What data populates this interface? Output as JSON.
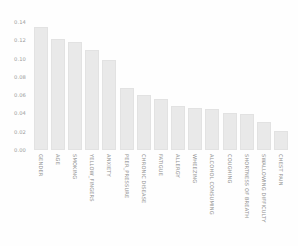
{
  "chart_data": {
    "type": "bar",
    "title": "",
    "xlabel": "",
    "ylabel": "",
    "ylim": [
      0.0,
      0.14
    ],
    "yticks": [
      "0.14",
      "0.12",
      "0.10",
      "0.08",
      "0.06",
      "0.04",
      "0.02",
      "0.00"
    ],
    "ytick_values": [
      0.14,
      0.12,
      0.1,
      0.08,
      0.06,
      0.04,
      0.02,
      0.0
    ],
    "grid": false,
    "legend": "none",
    "categories": [
      "GENDER",
      "AGE",
      "SMOKING",
      "YELLOW_FINGERS",
      "ANXIETY",
      "PEER_PRESSURE",
      "CHRONIC DISEASE",
      "FATIGUE",
      "ALLERGY",
      "WHEEZING",
      "ALCOHOL CONSUMING",
      "COUGHING",
      "SHORTNESS OF BREATH",
      "SWALLOWING DIFFICULTY",
      "CHEST PAIN"
    ],
    "values": [
      0.1345,
      0.1215,
      0.1185,
      0.1095,
      0.0985,
      0.0675,
      0.0605,
      0.0555,
      0.048,
      0.046,
      0.045,
      0.04,
      0.0395,
      0.0305,
      0.021
    ],
    "bar_color": "#e9e9e9",
    "background_color": "#fefefe",
    "tick_color": "#9b9b9b"
  }
}
